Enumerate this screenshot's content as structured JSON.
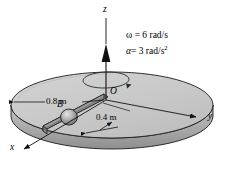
{
  "figure": {
    "background_color": "#ffffff",
    "disk": {
      "top_color": "#c9c9c9",
      "rim_color": "#a8a8a8",
      "outline_color": "#1a1a1a"
    },
    "ball": {
      "label": "B",
      "fill_color": "#b0b0b0"
    },
    "origin": {
      "label": "O"
    },
    "axes": [
      {
        "name": "z-axis",
        "label": "z"
      },
      {
        "name": "y-axis",
        "label": "y"
      },
      {
        "name": "x-axis",
        "label": "x"
      }
    ],
    "kinematics": [
      {
        "name": "angular-velocity",
        "text": "ω = 6 rad/s"
      },
      {
        "name": "angular-acceleration",
        "symbol": "α",
        "equals": "= 3 rad/s",
        "exponent": "2"
      }
    ],
    "dimensions": [
      {
        "name": "radius-dimension",
        "text": "0.8 m"
      },
      {
        "name": "ball-offset-dimension",
        "text": "0.4 m"
      }
    ]
  }
}
